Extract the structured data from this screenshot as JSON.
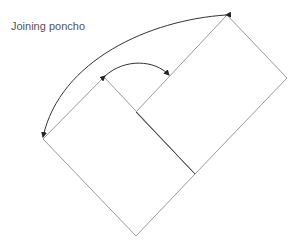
{
  "diagram": {
    "title": "Joining poncho",
    "colors": {
      "outline": "#9a9a9a",
      "inner_fold": "#444444",
      "arrow": "#333333",
      "title_text": "#555555",
      "background": "#ffffff"
    },
    "shapes": [
      {
        "name": "large-rectangle",
        "points": [
          [
            104,
            77
          ],
          [
            227,
            15
          ],
          [
            287,
            78
          ],
          [
            195,
            174
          ]
        ]
      },
      {
        "name": "lower-rectangle",
        "points": [
          [
            43,
            139
          ],
          [
            104,
            77
          ],
          [
            195,
            174
          ],
          [
            136,
            236
          ]
        ]
      },
      {
        "name": "center-fold-line",
        "points": [
          [
            104,
            77
          ],
          [
            195,
            174
          ]
        ]
      }
    ],
    "arrows": [
      {
        "name": "outer-arc-arrow",
        "from": [
          227,
          15
        ],
        "to": [
          43,
          139
        ]
      },
      {
        "name": "inner-arc-arrow",
        "from": [
          104,
          77
        ],
        "to": [
          169,
          75
        ]
      }
    ]
  }
}
